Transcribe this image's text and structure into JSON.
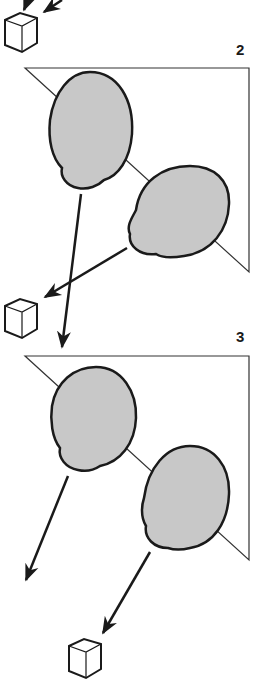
{
  "figure": {
    "panels": [
      {
        "id": "panel-2",
        "label": "2"
      },
      {
        "id": "panel-3",
        "label": "3"
      }
    ],
    "colors": {
      "stroke": "#1a1a1a",
      "cell_fill": "#c8c8c8",
      "background": "#ffffff"
    },
    "icons": [
      "cube-icon",
      "arrow-icon",
      "cell-icon",
      "triangle-frame"
    ]
  }
}
